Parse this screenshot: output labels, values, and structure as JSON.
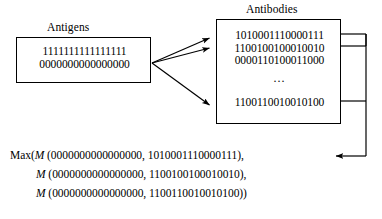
{
  "figure": {
    "background_color": "#ffffff",
    "line_color": "#000000"
  },
  "antigens": {
    "caption": "Antigens",
    "rows": [
      "1111111111111111",
      "0000000000000000"
    ]
  },
  "antibodies": {
    "caption": "Antibodies",
    "rows": [
      "1010001110000111",
      "1100100100010010",
      "0000110100011000"
    ],
    "ellipsis": "...",
    "last_row": "1100110010010100"
  },
  "formula": {
    "lines": [
      {
        "prefix": "Max(",
        "func": "M",
        "args": " (0000000000000000, 1010001110000111),",
        "indent": false
      },
      {
        "prefix": "",
        "func": "M",
        "args": " (0000000000000000, 1100100100010010),",
        "indent": true
      },
      {
        "prefix": "",
        "func": "M",
        "args": " (0000000000000000, 1100110010010100))",
        "indent": true
      }
    ]
  },
  "connectors": {
    "match_arrow_count": 3,
    "feedback_arrow_label": "feedback-arrow",
    "bus_tap_count": 3
  }
}
